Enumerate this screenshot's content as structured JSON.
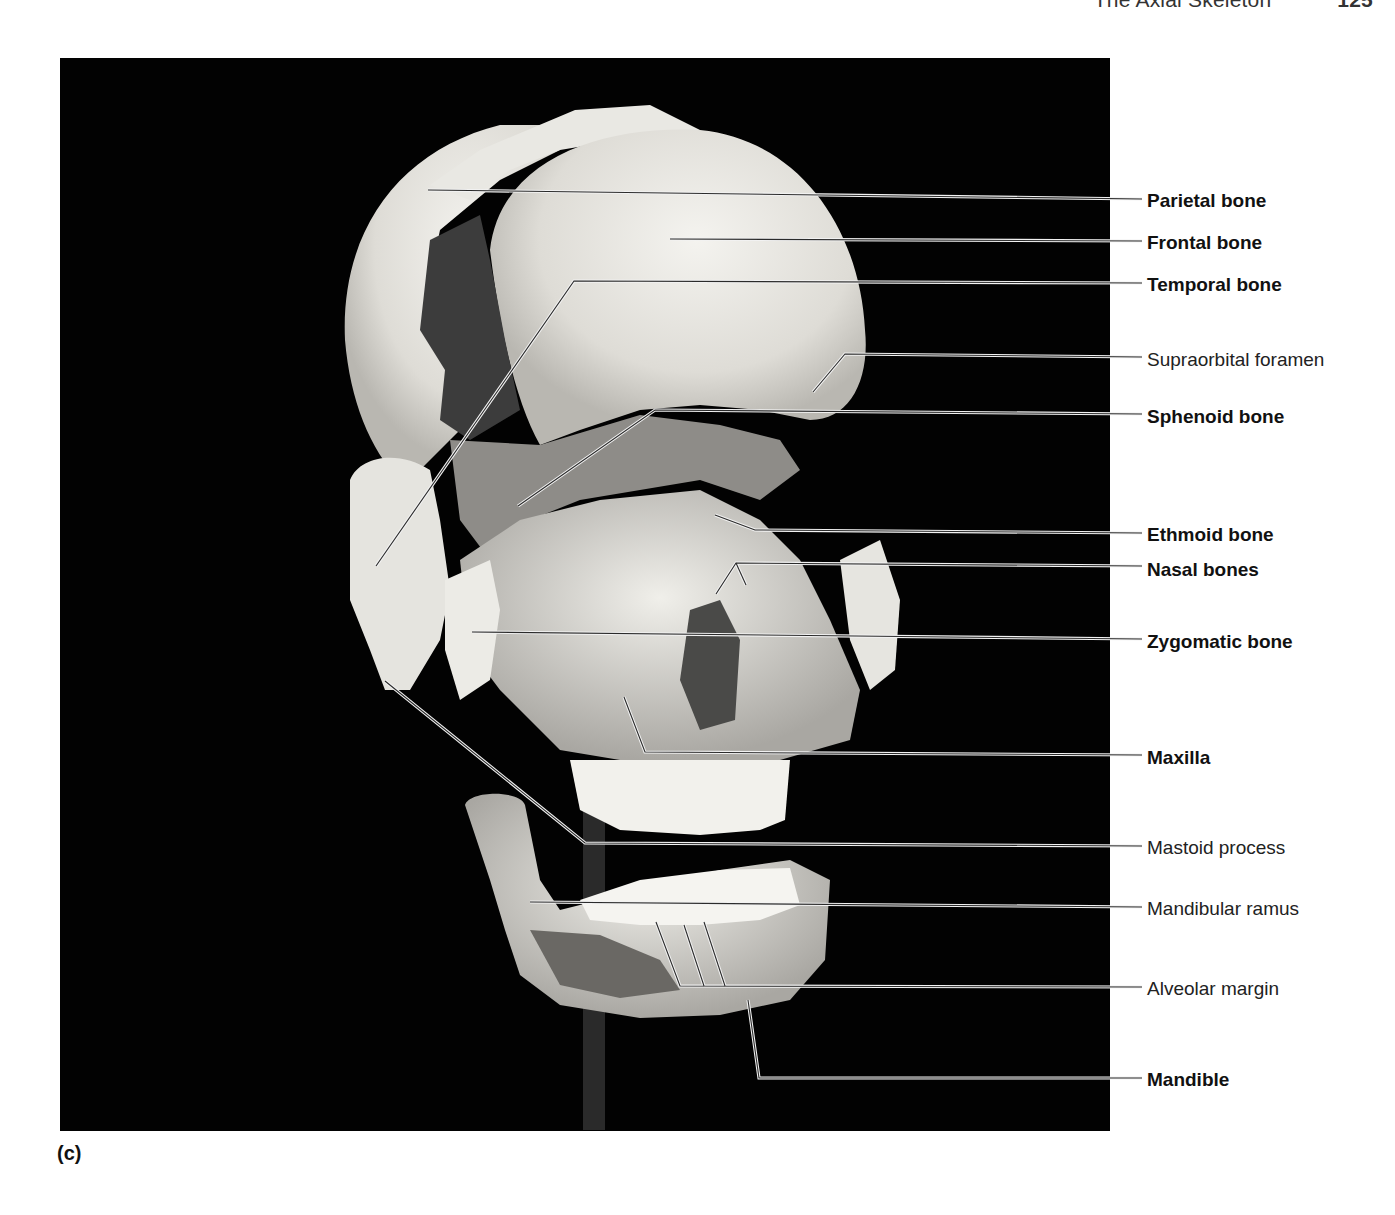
{
  "running_head": {
    "title": "The Axial Skeleton",
    "page_number": "125"
  },
  "figure": {
    "panel_letter": "(c)",
    "image_description": "Disarticulated (exploded) human skull model, anterolateral view, on black background",
    "colors": {
      "photo_background": "#020202",
      "bone": "#e8e6e0",
      "leader_line": "#333333",
      "label_text": "#111111"
    },
    "labels": [
      {
        "id": "parietal-bone",
        "text": "Parietal bone",
        "weight": "bold",
        "y": 201
      },
      {
        "id": "frontal-bone",
        "text": "Frontal bone",
        "weight": "bold",
        "y": 243
      },
      {
        "id": "temporal-bone",
        "text": "Temporal bone",
        "weight": "bold",
        "y": 285
      },
      {
        "id": "supraorbital-foramen",
        "text": "Supraorbital foramen",
        "weight": "regular",
        "y": 360
      },
      {
        "id": "sphenoid-bone",
        "text": "Sphenoid bone",
        "weight": "bold",
        "y": 417
      },
      {
        "id": "ethmoid-bone",
        "text": "Ethmoid bone",
        "weight": "bold",
        "y": 535
      },
      {
        "id": "nasal-bones",
        "text": "Nasal bones",
        "weight": "bold",
        "y": 570
      },
      {
        "id": "zygomatic-bone",
        "text": "Zygomatic bone",
        "weight": "bold",
        "y": 642
      },
      {
        "id": "maxilla",
        "text": "Maxilla",
        "weight": "bold",
        "y": 758
      },
      {
        "id": "mastoid-process",
        "text": "Mastoid process",
        "weight": "regular",
        "y": 848
      },
      {
        "id": "mandibular-ramus",
        "text": "Mandibular ramus",
        "weight": "regular",
        "y": 909
      },
      {
        "id": "alveolar-margin",
        "text": "Alveolar margin",
        "weight": "regular",
        "y": 989
      },
      {
        "id": "mandible",
        "text": "Mandible",
        "weight": "bold",
        "y": 1080
      }
    ]
  }
}
